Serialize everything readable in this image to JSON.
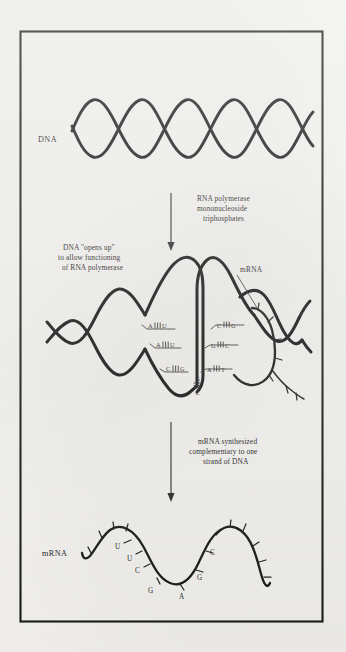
{
  "figure": {
    "background_color": "#f2f1ee",
    "ink_color": "#161616",
    "frame": {
      "x": 20,
      "y": 31,
      "width": 303,
      "height": 591
    }
  },
  "panels": {
    "dna_panel": {
      "label": "DNA",
      "label_x": 38,
      "label_y": 140,
      "description": "Intact DNA double helix drawn as two crossing strands"
    },
    "open_panel": {
      "caption": "DNA \"opens up\"\nto allow functioning\nof RNA polymerase",
      "caption_lines": [
        "DNA \"opens up\"",
        "to allow functioning",
        "of RNA polymerase"
      ],
      "mrna_label": "mRNA"
    },
    "mrna_panel": {
      "label": "mRNA",
      "label_x": 42,
      "label_y": 553
    }
  },
  "arrows": {
    "arrow_1": {
      "caption_lines": [
        "RNA polymerase",
        "mononucleoside",
        "triphosphates"
      ],
      "x": 171,
      "y_start": 193,
      "y_end": 249
    },
    "arrow_2": {
      "caption_lines": [
        "mRNA synthesized",
        "complementary to one",
        "strand of DNA"
      ],
      "x": 171,
      "y_start": 422,
      "y_end": 500
    }
  },
  "base_pairs": {
    "left_rungs": [
      {
        "template": "A",
        "transcript": "U",
        "bonds": 3
      },
      {
        "template": "A",
        "transcript": "U",
        "bonds": 3
      },
      {
        "template": "C",
        "transcript": "G",
        "bonds": 3
      }
    ],
    "bottom_rung": {
      "template": "G",
      "transcript": "C",
      "bonds": 3
    },
    "right_rungs": [
      {
        "template": "C",
        "transcript": "G",
        "bonds": 3
      },
      {
        "template": "G",
        "transcript": "C",
        "bonds": 3
      },
      {
        "template": "A",
        "transcript": "T",
        "bonds": 3
      }
    ]
  },
  "mrna_sequence": {
    "bases": [
      "U",
      "U",
      "C",
      "G",
      "A",
      "G",
      "C"
    ],
    "positions": [
      {
        "base": "U",
        "x": 118,
        "y": 546
      },
      {
        "base": "U",
        "x": 130,
        "y": 557
      },
      {
        "base": "C",
        "x": 139,
        "y": 567
      },
      {
        "base": "G",
        "x": 153,
        "y": 590
      },
      {
        "base": "A",
        "x": 182,
        "y": 595
      },
      {
        "base": "G",
        "x": 199,
        "y": 577
      },
      {
        "base": "C",
        "x": 212,
        "y": 551
      }
    ]
  }
}
